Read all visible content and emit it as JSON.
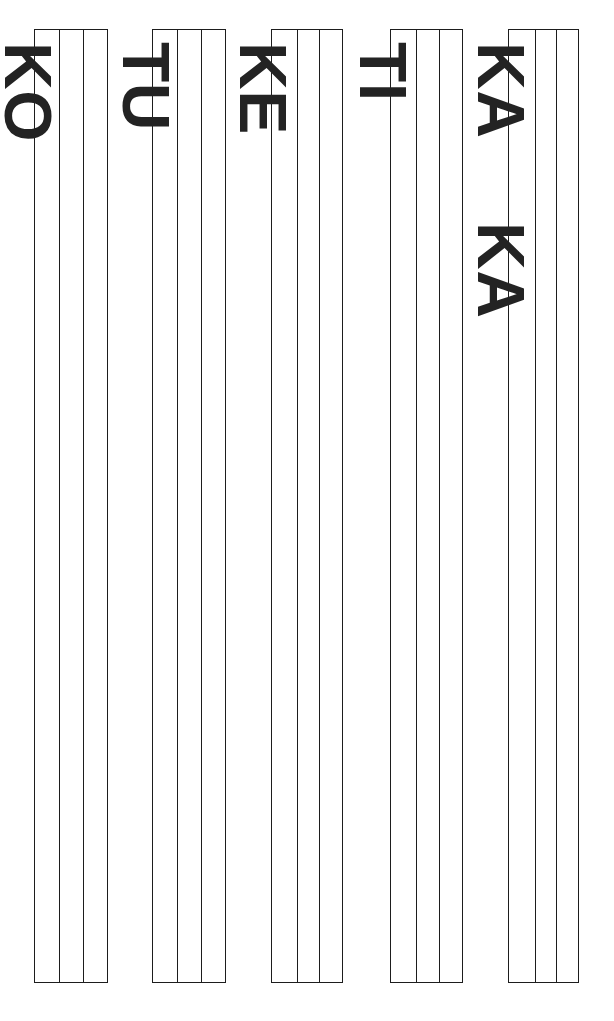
{
  "page": {
    "background_color": "#ffffff",
    "stroke_color": "#1d1d1d",
    "text_color": "#232323",
    "width": 614,
    "height": 1021
  },
  "columns": [
    {
      "id": "column-1",
      "label": "KO",
      "label_parts": [
        "KO"
      ],
      "x": 34,
      "y": 29,
      "width": 74,
      "height": 954,
      "panel_dividers": [
        24,
        48
      ],
      "label_font_size": 66,
      "label_offset_top": 12,
      "label_left_in_group": 26
    },
    {
      "id": "column-2",
      "label": "TU",
      "label_parts": [
        "TU"
      ],
      "x": 152,
      "y": 29,
      "width": 74,
      "height": 954,
      "panel_dividers": [
        24,
        48
      ],
      "label_font_size": 66,
      "label_offset_top": 12,
      "label_left_in_group": 26
    },
    {
      "id": "column-3",
      "label": "KE",
      "label_parts": [
        "KE"
      ],
      "x": 271,
      "y": 29,
      "width": 72,
      "height": 954,
      "panel_dividers": [
        25,
        47
      ],
      "label_font_size": 66,
      "label_offset_top": 12,
      "label_left_in_group": 24
    },
    {
      "id": "column-4",
      "label": "TI",
      "label_parts": [
        "TI"
      ],
      "x": 390,
      "y": 29,
      "width": 73,
      "height": 954,
      "panel_dividers": [
        25,
        48
      ],
      "label_font_size": 66,
      "label_offset_top": 12,
      "label_left_in_group": 25
    },
    {
      "id": "column-5",
      "label": "KA KA",
      "label_parts": [
        "KA",
        "KA"
      ],
      "x": 508,
      "y": 29,
      "width": 71,
      "height": 954,
      "panel_dividers": [
        26,
        47
      ],
      "label_font_size": 66,
      "label_offset_top": 12,
      "label_left_in_group": 25
    }
  ],
  "chart_data": {
    "type": "diagram",
    "categories": [
      "KO",
      "TU",
      "KE",
      "TI",
      "KA KA"
    ],
    "values": [
      1,
      1,
      1,
      1,
      2
    ],
    "series": [
      {
        "name": "labels_per_column",
        "values": [
          1,
          1,
          1,
          1,
          2
        ]
      },
      {
        "name": "panels_per_column",
        "values": [
          3,
          3,
          3,
          3,
          3
        ]
      }
    ],
    "xlabel": "",
    "ylabel": "",
    "grid": false,
    "legend": "none"
  }
}
